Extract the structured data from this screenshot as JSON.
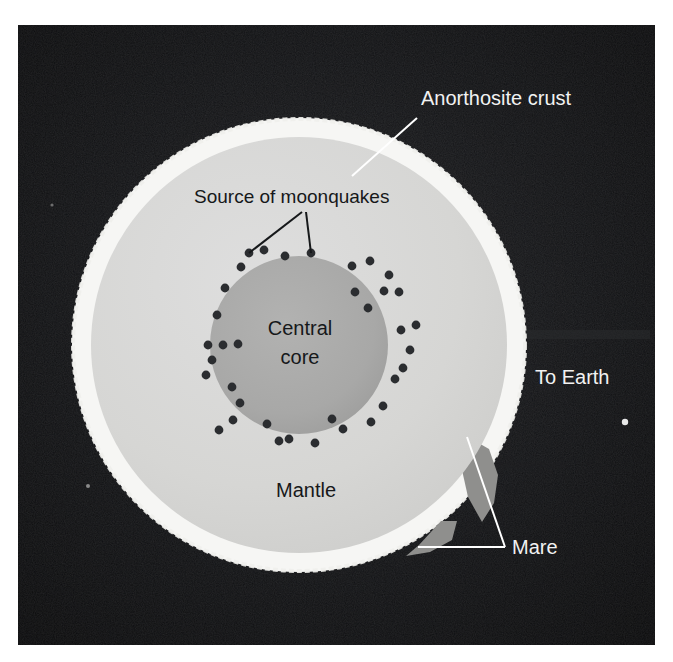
{
  "figure": {
    "kind": "cutaway-cross-section-diagram",
    "canvas": {
      "width": 673,
      "height": 662
    },
    "background_color": "#ffffff",
    "panel": {
      "name": "photographic-plate",
      "x": 18,
      "y": 25,
      "width": 637,
      "height": 620,
      "fill_color": "#0a0a0c",
      "vignette_color": "#1c1d20"
    }
  },
  "moon": {
    "center_x": 299,
    "center_y": 345,
    "outer_radius": 227,
    "layers": [
      {
        "name": "anorthosite-crust",
        "label": "Anorthosite crust",
        "outer_radius": 227,
        "inner_radius": 208,
        "color": "#f6f6f4"
      },
      {
        "name": "mantle",
        "label": "Mantle",
        "outer_radius": 208,
        "inner_radius": 89,
        "color": "#d6d6d4"
      },
      {
        "name": "central-core",
        "label": "Central core",
        "outer_radius": 89,
        "inner_radius": 0,
        "color": "#a9a9a8"
      }
    ],
    "mare_color": "#8f8f8d"
  },
  "labels": {
    "anorthosite_crust": {
      "text": "Anorthosite crust",
      "color": "#f2f2f2",
      "font_size": 20,
      "x": 421,
      "y": 105,
      "anchor": "start",
      "leader": {
        "x1": 417,
        "y1": 118,
        "x2": 352,
        "y2": 176,
        "color": "#ffffff",
        "width": 2
      }
    },
    "source_of_moonquakes": {
      "text": "Source of moonquakes",
      "color": "#16181a",
      "font_size": 19,
      "x": 194,
      "y": 203,
      "anchor": "start",
      "leaders": [
        {
          "x1": 302,
          "y1": 212,
          "x2": 249,
          "y2": 253,
          "color": "#16181a",
          "width": 2
        },
        {
          "x1": 306,
          "y1": 212,
          "x2": 311,
          "y2": 253,
          "color": "#16181a",
          "width": 2
        }
      ]
    },
    "central_core": {
      "line1": "Central",
      "line2": "core",
      "color": "#16181a",
      "font_size": 20,
      "x": 300,
      "y1": 335,
      "y2": 364,
      "anchor": "middle"
    },
    "mantle": {
      "text": "Mantle",
      "color": "#16181a",
      "font_size": 20,
      "x": 306,
      "y": 497,
      "anchor": "middle"
    },
    "to_earth": {
      "text": "To Earth",
      "color": "#f2f2f2",
      "font_size": 20,
      "x": 535,
      "y": 384,
      "anchor": "start"
    },
    "mare": {
      "text": "Mare",
      "color": "#f2f2f2",
      "font_size": 20,
      "x": 512,
      "y": 554,
      "anchor": "start",
      "leaders": [
        {
          "x1": 505,
          "y1": 547,
          "x2": 467,
          "y2": 437,
          "color": "#ffffff",
          "width": 2
        },
        {
          "x1": 505,
          "y1": 547,
          "x2": 418,
          "y2": 547,
          "color": "#ffffff",
          "width": 2
        }
      ]
    }
  },
  "mare_patches": [
    {
      "name": "mare-east-limb",
      "points": "468,437 489,449 498,475 494,503 482,522 468,497 462,470"
    },
    {
      "name": "mare-southeast-limb",
      "points": "419,545 441,521 457,521 452,540 430,552 406,556"
    }
  ],
  "moonquakes": {
    "label": "Source of moonquakes",
    "dot_color": "#2b2d30",
    "dot_radius": 4.4,
    "count": 36,
    "points": [
      [
        249,
        253
      ],
      [
        311,
        253
      ],
      [
        241,
        267
      ],
      [
        352,
        266
      ],
      [
        370,
        261
      ],
      [
        285,
        256
      ],
      [
        225,
        288
      ],
      [
        389,
        275
      ],
      [
        384,
        291
      ],
      [
        399,
        292
      ],
      [
        223,
        345
      ],
      [
        208,
        345
      ],
      [
        238,
        344
      ],
      [
        217,
        315
      ],
      [
        206,
        375
      ],
      [
        232,
        387
      ],
      [
        240,
        403
      ],
      [
        233,
        420
      ],
      [
        267,
        424
      ],
      [
        279,
        441
      ],
      [
        289,
        439
      ],
      [
        332,
        419
      ],
      [
        343,
        429
      ],
      [
        315,
        443
      ],
      [
        401,
        330
      ],
      [
        416,
        325
      ],
      [
        410,
        350
      ],
      [
        403,
        368
      ],
      [
        395,
        379
      ],
      [
        383,
        406
      ],
      [
        371,
        422
      ],
      [
        264,
        250
      ],
      [
        355,
        292
      ],
      [
        368,
        308
      ],
      [
        212,
        360
      ],
      [
        219,
        430
      ]
    ]
  },
  "starfield": [
    {
      "name": "star-speck-right",
      "x": 625,
      "y": 422,
      "r": 3.2,
      "color": "#e8e8e8"
    },
    {
      "name": "star-speck-lower-left",
      "x": 88,
      "y": 486,
      "r": 2.0,
      "color": "#8a8a8a"
    },
    {
      "name": "star-speck-mid-left",
      "x": 52,
      "y": 205,
      "r": 1.6,
      "color": "#6d6d6d"
    }
  ]
}
